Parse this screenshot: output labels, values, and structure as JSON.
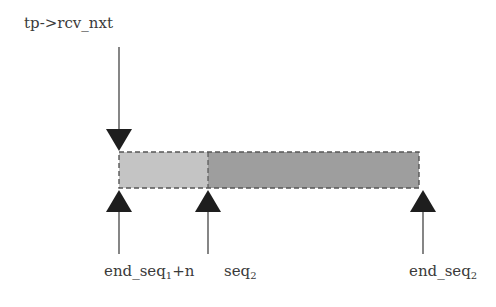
{
  "diagram": {
    "type": "sequence-space buffer",
    "pointer_label": "tp->rcv_nxt",
    "segments": [
      {
        "name": "segment-1",
        "fill": "#c4c4c4",
        "x_start": 119,
        "x_end": 208
      },
      {
        "name": "segment-2",
        "fill": "#9e9e9e",
        "x_start": 208,
        "x_end": 419
      }
    ],
    "markers": [
      {
        "base": "end_seq",
        "sub": "1",
        "suffix": "+n",
        "x": 119
      },
      {
        "base": "seq",
        "sub": "2",
        "suffix": "",
        "x": 208
      },
      {
        "base": "end_seq",
        "sub": "2",
        "suffix": "",
        "x": 423
      }
    ],
    "colors": {
      "arrow": "#1e1e1e",
      "border": "#555555",
      "text": "#3a3a3a"
    }
  }
}
